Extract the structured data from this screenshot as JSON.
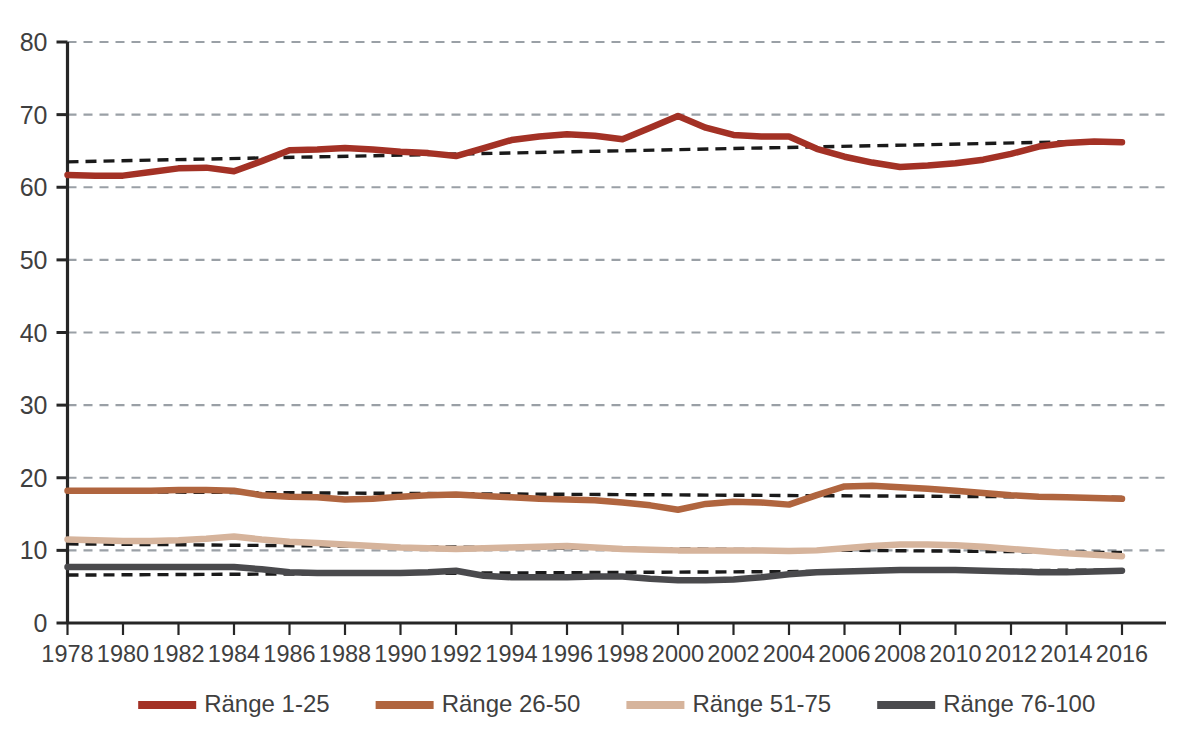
{
  "chart_data": {
    "type": "line",
    "title": "",
    "subtitle": "",
    "xlabel": "",
    "ylabel": "",
    "xlim": [
      1978,
      2016
    ],
    "ylim": [
      0,
      80
    ],
    "grid": true,
    "grid_style": "dashed-horizontal",
    "legend_position": "bottom",
    "yticks": [
      0,
      10,
      20,
      30,
      40,
      50,
      60,
      70,
      80
    ],
    "ytick_labels": [
      "0",
      "10",
      "20",
      "30",
      "40",
      "50",
      "60",
      "70",
      "80"
    ],
    "xticks": [
      1978,
      1980,
      1982,
      1984,
      1986,
      1988,
      1990,
      1992,
      1994,
      1996,
      1998,
      2000,
      2002,
      2004,
      2006,
      2008,
      2010,
      2012,
      2014,
      2016
    ],
    "xtick_labels": [
      "1978",
      "1980",
      "1982",
      "1984",
      "1986",
      "1988",
      "1990",
      "1992",
      "1994",
      "1996",
      "1998",
      "2000",
      "2002",
      "2004",
      "2006",
      "2008",
      "2010",
      "2012",
      "2014",
      "2016"
    ],
    "x": [
      1978,
      1979,
      1980,
      1981,
      1982,
      1983,
      1984,
      1985,
      1986,
      1987,
      1988,
      1989,
      1990,
      1991,
      1992,
      1993,
      1994,
      1995,
      1996,
      1997,
      1998,
      1999,
      2000,
      2001,
      2002,
      2003,
      2004,
      2005,
      2006,
      2007,
      2008,
      2009,
      2010,
      2011,
      2012,
      2013,
      2014,
      2015,
      2016
    ],
    "series": [
      {
        "name": "Ränge 1-25",
        "color": "#a33125",
        "values": [
          61.7,
          61.6,
          61.6,
          62.1,
          62.6,
          62.7,
          62.2,
          63.6,
          65.1,
          65.2,
          65.4,
          65.2,
          64.9,
          64.7,
          64.3,
          65.4,
          66.5,
          67.0,
          67.3,
          67.1,
          66.6,
          68.2,
          69.8,
          68.2,
          67.2,
          67.0,
          67.0,
          65.3,
          64.2,
          63.4,
          62.8,
          63.0,
          63.3,
          63.8,
          64.6,
          65.6,
          66.1,
          66.3,
          66.2
        ],
        "trend": {
          "start": 63.5,
          "end": 66.4,
          "style": "dashed",
          "color": "#1a1a1a"
        }
      },
      {
        "name": "Ränge 26-50",
        "color": "#b0653f",
        "values": [
          18.2,
          18.2,
          18.2,
          18.2,
          18.3,
          18.3,
          18.2,
          17.6,
          17.4,
          17.3,
          17.0,
          17.1,
          17.4,
          17.6,
          17.7,
          17.5,
          17.3,
          17.1,
          17.0,
          16.9,
          16.6,
          16.2,
          15.6,
          16.4,
          16.7,
          16.6,
          16.3,
          17.6,
          18.8,
          18.9,
          18.7,
          18.5,
          18.2,
          17.9,
          17.6,
          17.4,
          17.3,
          17.2,
          17.1
        ],
        "trend": {
          "start": 18.1,
          "end": 17.3,
          "style": "dashed",
          "color": "#1a1a1a"
        }
      },
      {
        "name": "Ränge 51-75",
        "color": "#d6b49c",
        "values": [
          11.5,
          11.4,
          11.3,
          11.3,
          11.4,
          11.6,
          11.9,
          11.5,
          11.2,
          11.0,
          10.8,
          10.6,
          10.4,
          10.3,
          10.2,
          10.3,
          10.4,
          10.5,
          10.6,
          10.4,
          10.2,
          10.1,
          10.0,
          10.0,
          10.0,
          10.0,
          9.9,
          10.0,
          10.3,
          10.6,
          10.8,
          10.8,
          10.7,
          10.5,
          10.2,
          9.9,
          9.6,
          9.4,
          9.2
        ],
        "trend": {
          "start": 10.9,
          "end": 9.7,
          "style": "dashed",
          "color": "#1a1a1a"
        }
      },
      {
        "name": "Ränge 76-100",
        "color": "#4a4a4d",
        "values": [
          7.7,
          7.7,
          7.7,
          7.7,
          7.7,
          7.7,
          7.7,
          7.4,
          7.0,
          6.9,
          6.9,
          6.9,
          6.9,
          7.0,
          7.2,
          6.5,
          6.3,
          6.3,
          6.3,
          6.4,
          6.4,
          6.1,
          5.9,
          5.9,
          6.0,
          6.3,
          6.7,
          7.0,
          7.1,
          7.2,
          7.3,
          7.3,
          7.3,
          7.2,
          7.1,
          7.0,
          7.0,
          7.1,
          7.2
        ],
        "trend": {
          "start": 6.6,
          "end": 7.3,
          "style": "dashed",
          "color": "#1a1a1a"
        }
      }
    ],
    "legend": [
      {
        "label": "Ränge 1-25",
        "color": "#a33125"
      },
      {
        "label": "Ränge 26-50",
        "color": "#b0653f"
      },
      {
        "label": "Ränge 51-75",
        "color": "#d6b49c"
      },
      {
        "label": "Ränge 76-100",
        "color": "#4a4a4d"
      }
    ]
  },
  "colors": {
    "background": "#ffffff",
    "axis": "#262626",
    "gridline": "#9aa0a6",
    "trendline": "#1a1a1a",
    "tick_text": "#3f3f3f"
  }
}
